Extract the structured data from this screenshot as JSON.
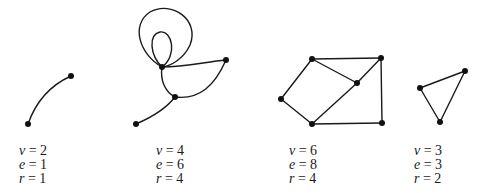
{
  "figure": {
    "type": "planar-graphs-euler-formula",
    "graphs": [
      {
        "id": "graph-1",
        "vertices": [
          [
            28,
            124
          ],
          [
            71,
            76
          ]
        ],
        "edges_paths": [
          "M28,124 Q40,90 71,76"
        ],
        "labels": {
          "v": "v = 2",
          "e": "e = 1",
          "r": "r = 1"
        },
        "values": {
          "v": 2,
          "e": 1,
          "r": 1
        }
      },
      {
        "id": "graph-2",
        "vertices": [
          [
            162,
            67
          ],
          [
            226,
            60
          ],
          [
            175,
            97
          ],
          [
            136,
            124
          ]
        ],
        "edges_paths": [
          "M162,67 C140,55 130,25 150,12 C172,0 200,20 190,45 C183,60 170,66 162,67",
          "M162,67 C150,55 148,35 160,32 C172,30 178,55 162,67",
          "M162,67 C185,67 205,62 226,60",
          "M226,60 C215,85 200,100 175,97",
          "M162,67 C160,80 165,92 175,97",
          "M175,97 C165,110 150,118 136,124"
        ],
        "labels": {
          "v": "v = 4",
          "e": "e = 6",
          "r": "r = 4"
        },
        "values": {
          "v": 4,
          "e": 6,
          "r": 4
        }
      },
      {
        "id": "graph-3",
        "vertices": [
          [
            312,
            59
          ],
          [
            381,
            58
          ],
          [
            357,
            83
          ],
          [
            281,
            99
          ],
          [
            312,
            124
          ],
          [
            382,
            123
          ]
        ],
        "edges": [
          [
            0,
            1
          ],
          [
            0,
            2
          ],
          [
            1,
            2
          ],
          [
            0,
            3
          ],
          [
            3,
            4
          ],
          [
            2,
            4
          ],
          [
            1,
            5
          ],
          [
            4,
            5
          ]
        ],
        "labels": {
          "v": "v = 6",
          "e": "e = 8",
          "r": "r = 4"
        },
        "values": {
          "v": 6,
          "e": 8,
          "r": 4
        }
      },
      {
        "id": "graph-4",
        "vertices": [
          [
            420,
            88
          ],
          [
            465,
            71
          ],
          [
            440,
            122
          ]
        ],
        "edges": [
          [
            0,
            1
          ],
          [
            1,
            2
          ],
          [
            2,
            0
          ]
        ],
        "labels": {
          "v": "v = 3",
          "e": "e = 3",
          "r": "r = 2"
        },
        "values": {
          "v": 3,
          "e": 3,
          "r": 2
        }
      }
    ],
    "label_positions": [
      {
        "x": 19
      },
      {
        "x": 156
      },
      {
        "x": 289
      },
      {
        "x": 414
      }
    ],
    "colors": {
      "ink": "#1a1a1a",
      "background": "#ffffff"
    }
  }
}
